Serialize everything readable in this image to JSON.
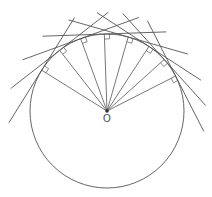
{
  "figure": {
    "type": "geometry-diagram",
    "center_label": "O",
    "center": {
      "x": 107,
      "y": 111
    },
    "radius": 77,
    "tangent_point_angles_deg": [
      148,
      128,
      110,
      92,
      74,
      57,
      42,
      27
    ],
    "tangent_half_length": 62,
    "right_angle_marker_size": 5,
    "stroke_color": "#555555",
    "circle_color": "#666666",
    "label_color": "#444444"
  }
}
